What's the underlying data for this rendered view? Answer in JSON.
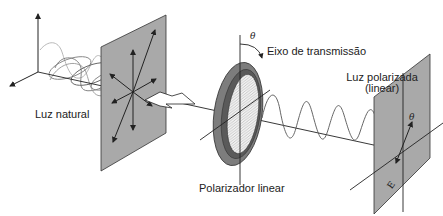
{
  "diagram": {
    "type": "polarization-of-light",
    "labels": {
      "natural_light": "Luz natural",
      "transmission_axis": "Eixo de transmissão",
      "polarized_light_line1": "Luz polarizada",
      "polarized_light_line2": "(linear)",
      "linear_polarizer": "Polarizador linear",
      "theta_polarizer": "θ",
      "theta_screen": "θ",
      "field_vector": "E"
    },
    "colors": {
      "panel": "#a9a9a9",
      "panel_stroke": "#333333",
      "ring": "#7d7d7d",
      "ring_dark": "#5a5a5a",
      "lines": "#222222",
      "wave_light": "#9a9a9a"
    }
  }
}
